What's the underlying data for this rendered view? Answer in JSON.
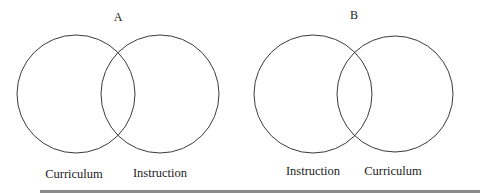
{
  "diagram": {
    "stroke_color": "#3a3a3a",
    "panels": [
      {
        "label": "A",
        "left_circle": {
          "label": "Curriculum"
        },
        "right_circle": {
          "label": "Instruction"
        }
      },
      {
        "label": "B",
        "left_circle": {
          "label": "Instruction"
        },
        "right_circle": {
          "label": "Curriculum"
        }
      }
    ]
  }
}
